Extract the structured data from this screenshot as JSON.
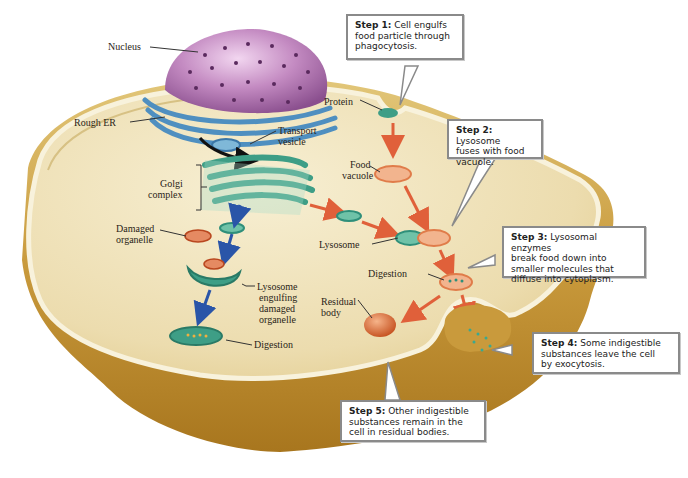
{
  "diagram": {
    "structure_labels": {
      "nucleus": "Nucleus",
      "rough_er": "Rough ER",
      "transport_vesicle_1": "Transport",
      "transport_vesicle_2": "vesicle",
      "golgi_1": "Golgi",
      "golgi_2": "complex",
      "damaged_1": "Damaged",
      "damaged_2": "organelle",
      "engulf_1": "Lysosome",
      "engulf_2": "engulfing",
      "engulf_3": "damaged",
      "engulf_4": "organelle",
      "digestion_left": "Digestion",
      "protein": "Protein",
      "food_vacuole_1": "Food",
      "food_vacuole_2": "vacuole",
      "lysosome": "Lysosome",
      "digestion_right": "Digestion",
      "residual_1": "Residual",
      "residual_2": "body"
    },
    "steps": [
      {
        "title": "Step 1:",
        "text_1": "Cell engulfs",
        "text_2": "food particle through",
        "text_3": "phagocytosis."
      },
      {
        "title": "Step 2:",
        "text_1": "Lysosome",
        "text_2": "fuses with food",
        "text_3": "vacuole."
      },
      {
        "title": "Step 3:",
        "text_1": "Lysosomal enzymes",
        "text_2": "break food down into",
        "text_3": "smaller molecules that",
        "text_4": "diffuse into cytoplasm."
      },
      {
        "title": "Step 4:",
        "text_1": "Some indigestible",
        "text_2": "substances leave the cell",
        "text_3": "by exocytosis."
      },
      {
        "title": "Step 5:",
        "text_1": "Other indigestible",
        "text_2": "substances remain in the",
        "text_3": "cell in residual bodies."
      }
    ],
    "colors": {
      "cytoplasm": "#efe3b8",
      "membrane": "#c9a24a",
      "nucleus": "#b27ab0",
      "er": "#4f8fc0",
      "golgi": "#3e9e86",
      "lysosome": "#2f8f7a",
      "food_vacuole": "#e59a6e",
      "arrow_red": "#e0603a",
      "arrow_blue": "#2a55a8"
    }
  }
}
